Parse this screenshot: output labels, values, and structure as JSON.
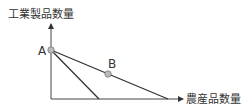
{
  "labels": {
    "y_axis": "工業製品数量",
    "x_axis": "農産品数量",
    "point_a": "A",
    "point_b": "B"
  },
  "colors": {
    "axis": "#444444",
    "line": "#333333",
    "point_fill": "#bbbbbb",
    "point_stroke": "#777777"
  }
}
